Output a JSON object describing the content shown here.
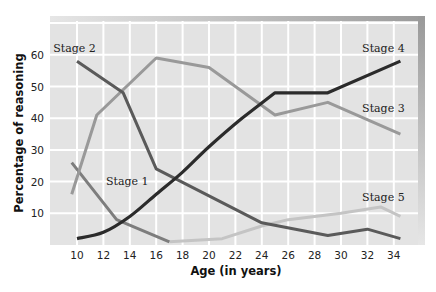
{
  "chart_data": {
    "type": "line",
    "title": "",
    "xlabel": "Age (in years)",
    "ylabel": "Percentage of reasoning",
    "xlim": [
      8,
      36.5
    ],
    "ylim": [
      0,
      70
    ],
    "xticks": [
      10,
      12,
      14,
      16,
      18,
      20,
      22,
      24,
      26,
      28,
      30,
      32,
      34
    ],
    "yticks": [
      10,
      20,
      30,
      40,
      50,
      60
    ],
    "grid": true,
    "legend": "inline-labels",
    "series": [
      {
        "name": "Stage 1",
        "color": "#7d7d7d",
        "x": [
          9.6,
          13,
          17
        ],
        "y": [
          26,
          8,
          1
        ]
      },
      {
        "name": "Stage 2",
        "color": "#5a5a5a",
        "x": [
          10,
          13.5,
          16,
          24,
          29,
          32,
          34.5
        ],
        "y": [
          58,
          48,
          24,
          7,
          3,
          5,
          2
        ]
      },
      {
        "name": "Stage 3",
        "color": "#999999",
        "x": [
          9.6,
          11.5,
          16,
          20,
          25,
          29,
          34.5
        ],
        "y": [
          16,
          41,
          59,
          56,
          41,
          45,
          35
        ]
      },
      {
        "name": "Stage 4",
        "color": "#2b2b2b",
        "x": [
          10,
          12,
          14,
          16,
          18,
          20,
          22.5,
          25,
          29,
          34.5
        ],
        "y": [
          2,
          4,
          9,
          16,
          23,
          31,
          40,
          48,
          48,
          58
        ]
      },
      {
        "name": "Stage 5",
        "color": "#c4c4c4",
        "x": [
          17,
          21,
          24,
          26,
          30,
          33,
          34.5
        ],
        "y": [
          1,
          2,
          6,
          8,
          10,
          12,
          9
        ]
      }
    ],
    "annotations": [
      {
        "text": "Stage 2",
        "x": 8.2,
        "y": 61
      },
      {
        "text": "Stage 1",
        "x": 12.2,
        "y": 19
      },
      {
        "text": "Stage 4",
        "x": 31.6,
        "y": 61
      },
      {
        "text": "Stage 3",
        "x": 31.6,
        "y": 42
      },
      {
        "text": "Stage 5",
        "x": 31.6,
        "y": 14
      }
    ]
  }
}
